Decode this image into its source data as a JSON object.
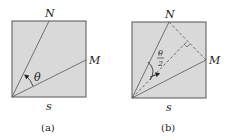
{
  "figures": [
    {
      "caption": "(a)",
      "labels": {
        "top": "N",
        "right": "M",
        "bottom": "s",
        "angle": "θ"
      }
    },
    {
      "caption": "(b)",
      "labels": {
        "top": "N",
        "right": "M",
        "bottom": "s",
        "angle_num": "θ",
        "angle_den": "2"
      }
    }
  ],
  "colors": {
    "fill": "#d9d9d9",
    "stroke": "#555555",
    "text": "#222222"
  }
}
